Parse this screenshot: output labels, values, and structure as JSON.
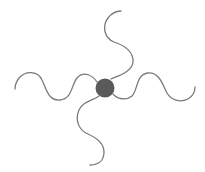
{
  "diagram": {
    "colors": {
      "background": "#ffffff",
      "core": "#5a5a5a",
      "arm": "#7a7a7a"
    },
    "core": {
      "cx": 105,
      "cy": 88,
      "r": 9.5
    },
    "arms": [
      {
        "id": "top",
        "d": "M 111 79 C 118 76, 132 72, 133 62 C 134 52, 124 45, 114 42 C 104 38, 102 26, 108 18 C 111 14, 116 11, 121 11"
      },
      {
        "id": "left",
        "d": "M 97 82 C 93 76, 84 70, 77 78 C 71 86, 72 99, 60 100 C 48 101, 46 88, 42 80 C 38 71, 26 70, 19 78 C 16 82, 15 86, 15 89"
      },
      {
        "id": "right",
        "d": "M 113 94 C 117 99, 126 101, 132 96 C 138 90, 136 74, 148 73 C 160 72, 163 86, 167 93 C 171 100, 180 103, 188 99 C 193 96, 195 91, 195 87"
      },
      {
        "id": "bottom",
        "d": "M 99 96 C 92 101, 82 102, 79 110 C 75 119, 78 130, 88 134 C 97 138, 104 143, 104 152 C 104 161, 98 165, 90 165"
      }
    ]
  }
}
